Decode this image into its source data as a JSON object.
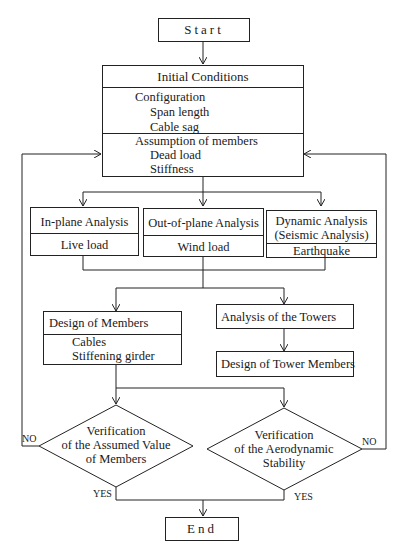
{
  "start": {
    "label": "Start"
  },
  "initial_conditions": {
    "title": "Initial Conditions",
    "configuration": {
      "heading": "Configuration",
      "items": [
        "Span length",
        "Cable sag"
      ]
    },
    "assumption": {
      "heading": "Assumption of members",
      "items": [
        "Dead load",
        "Stiffness"
      ]
    }
  },
  "analyses": [
    {
      "title": "In-plane Analysis",
      "load": "Live load"
    },
    {
      "title": "Out-of-plane Analysis",
      "load": "Wind load"
    },
    {
      "title_line1": "Dynamic Analysis",
      "title_line2": "(Seismic Analysis)",
      "load": "Earthquake"
    }
  ],
  "design_members": {
    "title": "Design of Members",
    "items": [
      "Cables",
      "Stiffening girder"
    ]
  },
  "towers": {
    "analysis": "Analysis of the Towers",
    "design": "Design of Tower Members"
  },
  "decisions": [
    {
      "lines": [
        "Verification",
        "of the Assumed Value",
        "of Members"
      ],
      "no": "NO",
      "yes": "YES"
    },
    {
      "lines": [
        "Verification",
        "of the Aerodynamic",
        "Stability"
      ],
      "no": "NO",
      "yes": "YES"
    }
  ],
  "end": {
    "label": "End"
  },
  "colors": {
    "line": "#222222",
    "background": "#ffffff",
    "text": "#1a1a1a"
  }
}
